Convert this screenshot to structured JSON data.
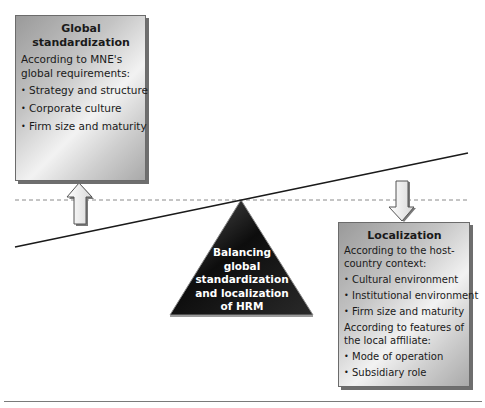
{
  "diagram": {
    "global_box": {
      "title": "Global standardization",
      "intro": "According to MNE's global requirements:",
      "items": [
        "Strategy and structure",
        "Corporate culture",
        "Firm size and maturity"
      ]
    },
    "local_box": {
      "title": "Localization",
      "intro1": "According to the host-country context:",
      "items1": [
        "Cultural environment",
        "Institutional environment",
        "Firm size and maturity"
      ],
      "intro2": "According to features of the local affiliate:",
      "items2": [
        "Mode of operation",
        "Subsidiary role"
      ]
    },
    "fulcrum": {
      "lines": [
        "Balancing",
        "global",
        "standardization",
        "and localization",
        "of HRM"
      ]
    },
    "bullet_glyph": "•",
    "colors": {
      "fulcrum_fill": "#111111",
      "box_border": "#6b6b6b",
      "lever_line": "#1a1a1a",
      "dashed_line": "#8a8a8a",
      "arrow_fill": "#ececec"
    }
  }
}
